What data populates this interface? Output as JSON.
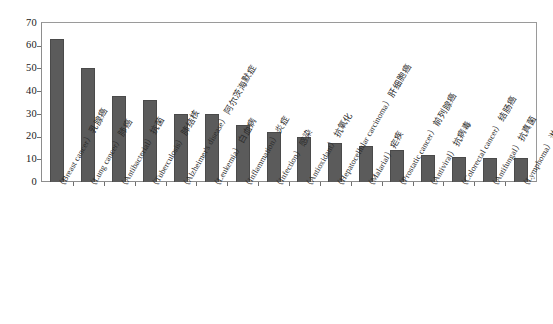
{
  "chart_data": {
    "type": "bar",
    "title": "",
    "subtitle": "",
    "xlabel": "",
    "ylabel": "",
    "ylim": [
      0,
      70
    ],
    "ytick_values": [
      0,
      10,
      20,
      30,
      40,
      50,
      60,
      70
    ],
    "ytick_labels": [
      "0",
      "10",
      "20",
      "30",
      "40",
      "50",
      "60",
      "70"
    ],
    "grid": false,
    "legend": false,
    "legend_position": "none",
    "bar_color": "#5b5b5b",
    "frame_color": "#8d8d8d",
    "axis_text_color": "#1a1a1a",
    "categories": [
      "乳腺癌（Breast cancer）",
      "肺癌（Lung cancer）",
      "抗菌（Antibacterial）",
      "肺结核（Tuberculosis）",
      "阿尔茨海默症（Alzheimer's disease）",
      "白血病（Leukemia）",
      "炎症（Inflammation）",
      "感染（Infection）",
      "抗氧化（Antioxidant）",
      "肝细胞癌（Hepatocellular carcinoma）",
      "疟疾（Malarial）",
      "前列腺癌（Prostatic cancer）",
      "抗病毒（Antiviral）",
      "结肠癌（Colorectal cancer）",
      "抗真菌（Antifungal）",
      "淋巴瘤（Lymphoma）"
    ],
    "category_parts": [
      {
        "zh": "乳腺癌",
        "en": "（Breast cancer）"
      },
      {
        "zh": "肺癌",
        "en": "（Lung cancer）"
      },
      {
        "zh": "抗菌",
        "en": "（Antibacterial）"
      },
      {
        "zh": "肺结核",
        "en": "（Tuberculosis）"
      },
      {
        "zh": "阿尔茨海默症",
        "en": "（Alzheimer's disease）"
      },
      {
        "zh": "白血病",
        "en": "（Leukemia）"
      },
      {
        "zh": "炎症",
        "en": "（Inflammation）"
      },
      {
        "zh": "感染",
        "en": "（Infection）"
      },
      {
        "zh": "抗氧化",
        "en": "（Antioxidant）"
      },
      {
        "zh": "肝细胞癌",
        "en": "（Hepatocellular carcinoma）"
      },
      {
        "zh": "疟疾",
        "en": "（Malarial）"
      },
      {
        "zh": "前列腺癌",
        "en": "（Prostatic cancer）"
      },
      {
        "zh": "抗病毒",
        "en": "（Antiviral）"
      },
      {
        "zh": "结肠癌",
        "en": "（Colorectal cancer）"
      },
      {
        "zh": "抗真菌",
        "en": "（Antifungal）"
      },
      {
        "zh": "淋巴瘤",
        "en": "（Lymphoma）"
      }
    ],
    "values": [
      63,
      50,
      38,
      36,
      30,
      30,
      25,
      22,
      20,
      17,
      16,
      14,
      12,
      11,
      10.5,
      10.5
    ]
  }
}
